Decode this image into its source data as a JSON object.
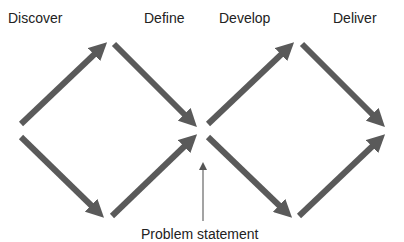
{
  "diagram": {
    "phases": [
      {
        "label": "Discover",
        "x": 8,
        "y": 10
      },
      {
        "label": "Define",
        "x": 144,
        "y": 10
      },
      {
        "label": "Develop",
        "x": 219,
        "y": 10
      },
      {
        "label": "Deliver",
        "x": 333,
        "y": 10
      }
    ],
    "annotation": {
      "label": "Problem statement",
      "x": 141,
      "y": 226
    },
    "colors": {
      "arrow": "#5a5a5a",
      "text": "#222222",
      "thin_arrow": "#666666"
    }
  }
}
